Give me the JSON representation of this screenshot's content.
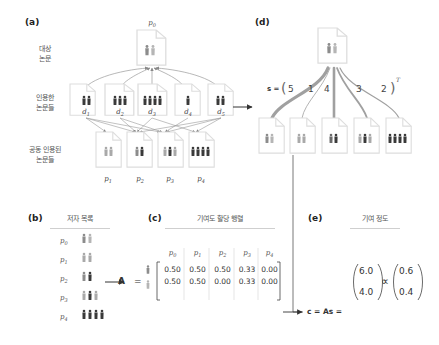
{
  "panels": {
    "a": {
      "label": "(a)",
      "rows": {
        "target": "대상\n논문",
        "citing": "인용한\n논문들",
        "cocited": "공동 인용된\n논문들"
      },
      "target_paper": {
        "name": "p0",
        "label": "p",
        "sub": "0"
      },
      "citing_papers": [
        {
          "label": "d",
          "sub": "1"
        },
        {
          "label": "d",
          "sub": "2"
        },
        {
          "label": "d",
          "sub": "3"
        },
        {
          "label": "d",
          "sub": "4"
        },
        {
          "label": "d",
          "sub": "5"
        }
      ],
      "cocited_papers": [
        {
          "label": "p",
          "sub": "1"
        },
        {
          "label": "p",
          "sub": "2"
        },
        {
          "label": "p",
          "sub": "3"
        },
        {
          "label": "p",
          "sub": "4"
        }
      ]
    },
    "b": {
      "label": "(b)",
      "title": "저자 목록",
      "papers": [
        {
          "label": "p",
          "sub": "0"
        },
        {
          "label": "p",
          "sub": "1"
        },
        {
          "label": "p",
          "sub": "2"
        },
        {
          "label": "p",
          "sub": "3"
        },
        {
          "label": "p",
          "sub": "4"
        }
      ]
    },
    "c": {
      "label": "(c)",
      "title": "기여도 할당 행렬",
      "matrix_symbol": "A",
      "equals": "=",
      "columns": [
        {
          "label": "p",
          "sub": "0"
        },
        {
          "label": "p",
          "sub": "1"
        },
        {
          "label": "p",
          "sub": "2"
        },
        {
          "label": "p",
          "sub": "3"
        },
        {
          "label": "p",
          "sub": "4"
        }
      ],
      "rows": [
        [
          "0.50",
          "0.50",
          "0.50",
          "0.33",
          "0.00"
        ],
        [
          "0.50",
          "0.50",
          "0.00",
          "0.33",
          "0.00"
        ]
      ]
    },
    "d": {
      "label": "(d)",
      "s_label": "s =",
      "s_values": [
        "5",
        "1",
        "4",
        "3",
        "2"
      ],
      "transpose": "T"
    },
    "e": {
      "label": "(e)",
      "title": "기여 정도",
      "equation_lhs": "c = As =",
      "vector_raw": [
        "6.0",
        "4.0"
      ],
      "proportional": "∝",
      "vector_norm": [
        "0.6",
        "0.4"
      ]
    }
  },
  "colors": {
    "light_author": "#a9a9a9",
    "dark_author": "#3a3a3a",
    "mid_author": "#8c8c8c",
    "edge": "#888888",
    "strong_edge": "#9a9a9a",
    "doc_border": "#dddddd"
  }
}
